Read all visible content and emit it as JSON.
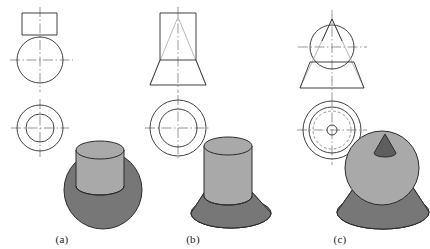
{
  "figure": {
    "type": "engineering-orthographic-projection-figure",
    "background_color": "#ffffff",
    "line_color": "#2b2b2b",
    "centerline_color": "#6b6b6b",
    "hidden_line_color": "#8a8a8a",
    "shade_light": "#a9a9a9",
    "shade_dark": "#777777",
    "shade_darkest": "#5e5e5e"
  },
  "captions": [
    {
      "label": "(a)",
      "x": 62,
      "y": 233
    },
    {
      "label": "(b)",
      "x": 193,
      "y": 233
    },
    {
      "label": "(c)",
      "x": 340,
      "y": 233
    }
  ],
  "parts": [
    {
      "id": "a",
      "name": "cylinder-on-sphere",
      "front_view": {
        "rectangle": {
          "x": 22,
          "y": 13,
          "width": 35,
          "height": 22
        },
        "circle": {
          "cx": 40,
          "cy": 60,
          "r": 23
        }
      },
      "top_view": {
        "circles": [
          {
            "cx": 40,
            "cy": 128,
            "r": 23,
            "style": "solid"
          },
          {
            "cx": 40,
            "cy": 128,
            "r": 14,
            "style": "solid"
          }
        ]
      },
      "solid": {
        "shapes": [
          "sphere",
          "cylinder"
        ],
        "sphere": {
          "cx": 103,
          "cy": 190,
          "r": 39,
          "fill": "#777777"
        },
        "cylinder": {
          "cx": 100,
          "cy": 175,
          "rx": 24,
          "ry": 9,
          "top_y": 145,
          "bottom_y": 186,
          "fill": "#a9a9a9"
        }
      }
    },
    {
      "id": "b",
      "name": "cylinder-on-cone-frustum",
      "front_view": {
        "rectangle": {
          "x": 160,
          "y": 13,
          "width": 36,
          "height": 47
        },
        "inner_triangle": {
          "apex_x": 178,
          "apex_y": 17,
          "left_x": 150,
          "right_x": 206,
          "base_y": 85
        },
        "trapezoid": {
          "top_left_x": 160,
          "top_right_x": 196,
          "top_y": 60,
          "bottom_left_x": 150,
          "bottom_right_x": 206,
          "bottom_y": 85
        }
      },
      "top_view": {
        "circles": [
          {
            "cx": 178,
            "cy": 128,
            "r": 28,
            "style": "solid"
          },
          {
            "cx": 178,
            "cy": 128,
            "r": 19,
            "style": "solid"
          }
        ]
      },
      "solid": {
        "shapes": [
          "cone-frustum",
          "cylinder"
        ],
        "frustum": {
          "cx": 231,
          "base_cy": 213,
          "base_rx": 40,
          "base_ry": 15,
          "top_rx": 22,
          "top_ry": 8,
          "top_cy": 186,
          "fill": "#777777"
        },
        "cylinder": {
          "cx": 228,
          "rx": 24,
          "ry": 9,
          "top_y": 146,
          "bottom_y": 196,
          "fill": "#a9a9a9"
        }
      }
    },
    {
      "id": "c",
      "name": "cone-on-sphere-on-frustum",
      "front_view": {
        "circle": {
          "cx": 332,
          "cy": 47,
          "r": 22
        },
        "cone_triangle": {
          "apex_x": 332,
          "apex_y": 19,
          "left_x": 300,
          "right_x": 364,
          "base_y": 88
        },
        "trapezoid": {
          "top_left_x": 310,
          "top_right_x": 354,
          "top_y": 62,
          "bottom_left_x": 300,
          "bottom_right_x": 364,
          "bottom_y": 88
        }
      },
      "top_view": {
        "circles": [
          {
            "cx": 332,
            "cy": 130,
            "r": 29,
            "style": "solid"
          },
          {
            "cx": 332,
            "cy": 130,
            "r": 23,
            "style": "solid"
          },
          {
            "cx": 332,
            "cy": 130,
            "r": 19,
            "style": "dashed"
          },
          {
            "cx": 332,
            "cy": 130,
            "r": 5,
            "style": "solid"
          }
        ]
      },
      "solid": {
        "shapes": [
          "cone-frustum",
          "sphere",
          "cone-tip"
        ],
        "frustum": {
          "cx": 383,
          "base_cy": 212,
          "base_rx": 46,
          "base_ry": 17,
          "fill": "#777777"
        },
        "sphere": {
          "cx": 382,
          "cy": 168,
          "r": 37,
          "fill": "#a9a9a9"
        },
        "cone_tip": {
          "apex_x": 385,
          "apex_y": 134,
          "base_cx": 385,
          "base_cy": 152,
          "base_rx": 11,
          "base_ry": 4,
          "fill": "#5e5e5e"
        }
      }
    }
  ]
}
